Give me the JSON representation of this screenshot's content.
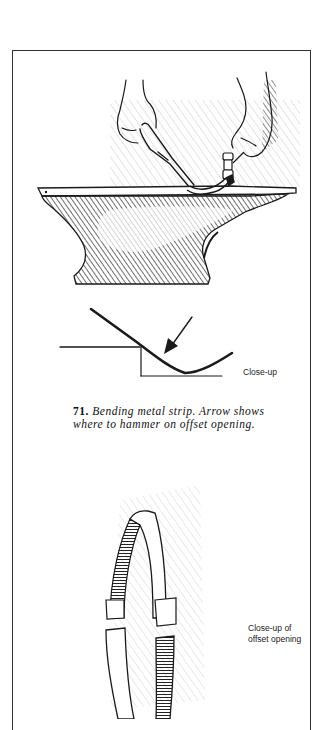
{
  "figure": {
    "number": "71.",
    "caption": "Bending metal strip. Arrow shows where to hammer on offset opening.",
    "caption_line1": "Bending metal strip. Arrow shows",
    "caption_line2": "where to hammer on offset opening."
  },
  "illustrations": {
    "anvil": {
      "subject": "hands holding tongs and hammer bending a metal strip on an anvil"
    },
    "closeup_bend": {
      "label": "Close-up"
    },
    "offset_ring": {
      "label_line1": "Close-up of",
      "label_line2": "offset opening"
    }
  },
  "colors": {
    "ink": "#1a1a1a",
    "paper": "#ffffff",
    "border": "#333333"
  }
}
